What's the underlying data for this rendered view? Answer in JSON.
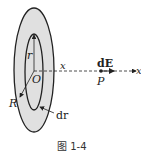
{
  "figure": {
    "caption": "图 1-4",
    "labels": {
      "r": "r",
      "O": "O",
      "R": "R",
      "dr": "dr",
      "x_mid": "x",
      "dE": "dE",
      "P": "P",
      "x_axis": "x"
    },
    "colors": {
      "disk_fill": "#e0e0e0",
      "stroke": "#222222"
    }
  }
}
